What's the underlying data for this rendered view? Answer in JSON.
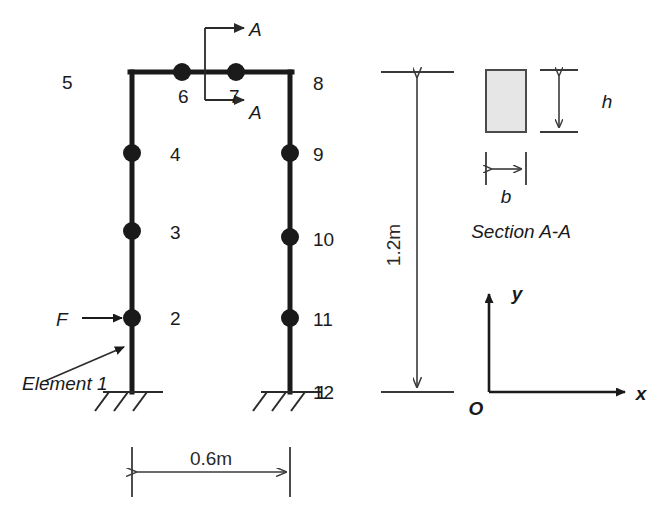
{
  "figure": {
    "type": "engineering-diagram"
  },
  "frame": {
    "node_labels": [
      {
        "id": "node-1",
        "text": "1",
        "x": 316,
        "y": 399
      },
      {
        "id": "node-2",
        "text": "2",
        "x": 170,
        "y": 325
      },
      {
        "id": "node-3",
        "text": "3",
        "x": 170,
        "y": 239
      },
      {
        "id": "node-4",
        "text": "4",
        "x": 170,
        "y": 161
      },
      {
        "id": "node-5",
        "text": "5",
        "x": 62,
        "y": 89
      },
      {
        "id": "node-6",
        "text": "6",
        "x": 178,
        "y": 103
      },
      {
        "id": "node-7",
        "text": "7",
        "x": 229,
        "y": 103
      },
      {
        "id": "node-8",
        "text": "8",
        "x": 313,
        "y": 90
      },
      {
        "id": "node-9",
        "text": "9",
        "x": 313,
        "y": 161
      },
      {
        "id": "node-10",
        "text": "10",
        "x": 313,
        "y": 246
      },
      {
        "id": "node-11",
        "text": "11",
        "x": 313,
        "y": 326
      },
      {
        "id": "node-12",
        "text": "12",
        "x": 313,
        "y": 399
      }
    ],
    "joint_dots": [
      {
        "cx": 132,
        "cy": 153,
        "r": 9
      },
      {
        "cx": 132,
        "cy": 231,
        "r": 9
      },
      {
        "cx": 132,
        "cy": 318,
        "r": 9
      },
      {
        "cx": 182,
        "cy": 72,
        "r": 9
      },
      {
        "cx": 236,
        "cy": 72,
        "r": 9
      },
      {
        "cx": 290,
        "cy": 153,
        "r": 9
      },
      {
        "cx": 290,
        "cy": 237,
        "r": 9
      },
      {
        "cx": 290,
        "cy": 318,
        "r": 9
      }
    ],
    "force_label": "F",
    "element_label": "Element 1",
    "section_marker_top": "A",
    "section_marker_bottom": "A"
  },
  "dimensions": {
    "width_label": "0.6m",
    "height_label": "1.2m"
  },
  "section": {
    "caption": "Section A-A",
    "height_label": "h",
    "width_label": "b"
  },
  "axes": {
    "origin_label": "O",
    "x_label": "x",
    "y_label": "y"
  },
  "colors": {
    "ink": "#1a1a1a",
    "thin_ink": "#2a2a2a",
    "section_fill": "#e6e6e6",
    "section_stroke": "#4a4a4a",
    "background": "#ffffff"
  }
}
